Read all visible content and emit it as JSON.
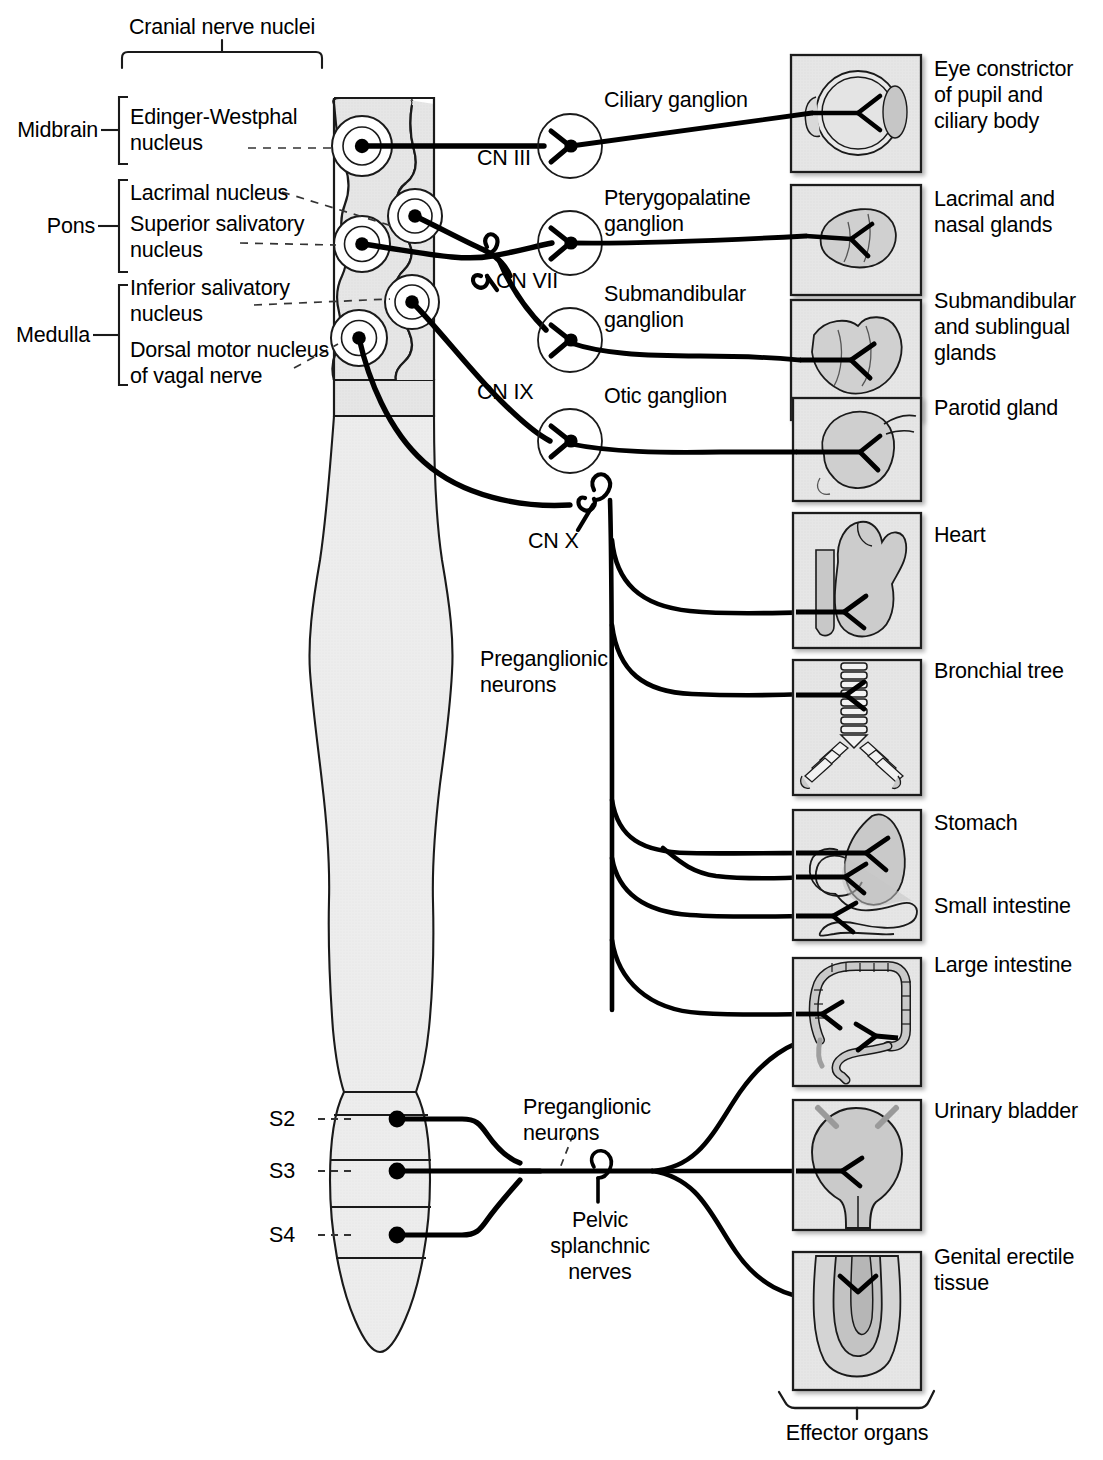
{
  "figure": {
    "title_bracket_top": "Cranial nerve nuclei",
    "title_bracket_bottom": "Effector organs"
  },
  "brain_regions": [
    {
      "label": "Midbrain"
    },
    {
      "label": "Pons"
    },
    {
      "label": "Medulla"
    }
  ],
  "nuclei": [
    {
      "label": "Edinger-Westphal\nnucleus",
      "region": "Midbrain"
    },
    {
      "label": "Lacrimal nucleus",
      "region": "Pons"
    },
    {
      "label": "Superior salivatory\nnucleus",
      "region": "Pons"
    },
    {
      "label": "Inferior salivatory\nnucleus",
      "region": "Medulla"
    },
    {
      "label": "Dorsal motor nucleus\nof vagal nerve",
      "region": "Medulla"
    }
  ],
  "cranial_nerves": [
    {
      "label": "CN III"
    },
    {
      "label": "CN VII"
    },
    {
      "label": "CN IX"
    },
    {
      "label": "CN X"
    }
  ],
  "ganglia": [
    {
      "label": "Ciliary ganglion"
    },
    {
      "label": "Pterygopalatine\nganglion"
    },
    {
      "label": "Submandibular\nganglion"
    },
    {
      "label": "Otic ganglion"
    }
  ],
  "spinal_segments": [
    {
      "label": "S2"
    },
    {
      "label": "S3"
    },
    {
      "label": "S4"
    }
  ],
  "annotations": [
    {
      "label": "Preganglionic\nneurons",
      "where": "cranial"
    },
    {
      "label": "Preganglionic\nneurons",
      "where": "sacral"
    },
    {
      "label": "Pelvic\nsplanchnic\nnerves",
      "where": "sacral"
    }
  ],
  "effector_organs": [
    {
      "label": "Eye constrictor\nof pupil and\nciliary body",
      "icon": "eye-icon"
    },
    {
      "label": "Lacrimal and\nnasal glands",
      "icon": "lacrimal-gland-icon"
    },
    {
      "label": "Submandibular\nand sublingual\nglands",
      "icon": "salivary-gland-icon"
    },
    {
      "label": "Parotid gland",
      "icon": "parotid-gland-icon"
    },
    {
      "label": "Heart",
      "icon": "heart-icon"
    },
    {
      "label": "Bronchial tree",
      "icon": "bronchial-tree-icon"
    },
    {
      "label": "Stomach",
      "icon": "stomach-icon"
    },
    {
      "label": "Small intestine",
      "icon": "small-intestine-icon"
    },
    {
      "label": "Large intestine",
      "icon": "large-intestine-icon"
    },
    {
      "label": "Urinary bladder",
      "icon": "bladder-icon"
    },
    {
      "label": "Genital erectile\ntissue",
      "icon": "genital-icon"
    }
  ],
  "colors": {
    "tissue_fill": "#e2e2e2",
    "cord_fill": "#eaeaea",
    "box_fill": "#eeeeee",
    "outline": "#1a1a1a",
    "nerve": "#000000"
  }
}
